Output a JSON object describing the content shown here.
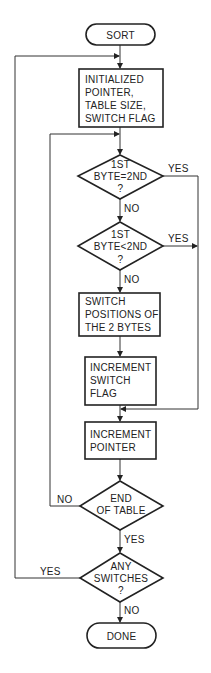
{
  "diagram": {
    "type": "flowchart",
    "title": "SORT",
    "nodes": {
      "start": {
        "label": "SORT",
        "shape": "terminal"
      },
      "init": {
        "lines": [
          "INITIALIZED",
          "POINTER,",
          "TABLE SIZE,",
          "SWITCH FLAG"
        ],
        "shape": "process"
      },
      "dec_equal": {
        "lines": [
          "1ST",
          "BYTE=2ND",
          "?"
        ],
        "shape": "decision"
      },
      "dec_less": {
        "lines": [
          "1ST",
          "BYTE<2ND",
          "?"
        ],
        "shape": "decision"
      },
      "switch_pos": {
        "lines": [
          "SWITCH",
          "POSITIONS OF",
          "THE 2 BYTES"
        ],
        "shape": "process"
      },
      "inc_flag": {
        "lines": [
          "INCREMENT",
          "SWITCH",
          "FLAG"
        ],
        "shape": "process"
      },
      "inc_ptr": {
        "lines": [
          "INCREMENT",
          "POINTER"
        ],
        "shape": "process"
      },
      "dec_end": {
        "lines": [
          "END",
          "OF TABLE"
        ],
        "shape": "decision"
      },
      "dec_any": {
        "lines": [
          "ANY",
          "SWITCHES",
          "?"
        ],
        "shape": "decision"
      },
      "end": {
        "label": "DONE",
        "shape": "terminal"
      }
    },
    "edge_labels": {
      "equal_yes": "YES",
      "equal_no": "NO",
      "less_yes": "YES",
      "less_no": "NO",
      "end_no": "NO",
      "end_yes": "YES",
      "any_yes": "YES",
      "any_no": "NO"
    },
    "edges": [
      {
        "from": "start",
        "to": "init"
      },
      {
        "from": "init",
        "to": "dec_equal"
      },
      {
        "from": "dec_equal",
        "to": "inc_ptr",
        "label": "YES"
      },
      {
        "from": "dec_equal",
        "to": "dec_less",
        "label": "NO"
      },
      {
        "from": "dec_less",
        "to": "inc_ptr",
        "label": "YES"
      },
      {
        "from": "dec_less",
        "to": "switch_pos",
        "label": "NO"
      },
      {
        "from": "switch_pos",
        "to": "inc_flag"
      },
      {
        "from": "inc_flag",
        "to": "inc_ptr"
      },
      {
        "from": "inc_ptr",
        "to": "dec_end"
      },
      {
        "from": "dec_end",
        "to": "dec_equal",
        "label": "NO"
      },
      {
        "from": "dec_end",
        "to": "dec_any",
        "label": "YES"
      },
      {
        "from": "dec_any",
        "to": "init",
        "label": "YES"
      },
      {
        "from": "dec_any",
        "to": "end",
        "label": "NO"
      }
    ]
  }
}
